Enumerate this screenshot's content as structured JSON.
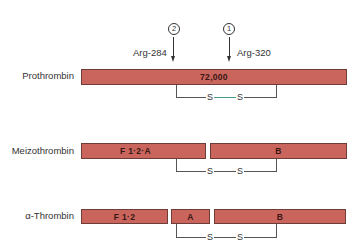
{
  "cleavage_sites": [
    {
      "number": "2",
      "label": "Arg-284"
    },
    {
      "number": "1",
      "label": "Arg-320"
    }
  ],
  "rows": [
    {
      "name": "Prothrombin",
      "segments": [
        {
          "label": "72,000"
        }
      ],
      "disulfide": {
        "left": "S",
        "right": "S"
      }
    },
    {
      "name": "Meizothrombin",
      "segments": [
        {
          "label": "F 1·2·A"
        },
        {
          "label": "B"
        }
      ],
      "disulfide": {
        "left": "S",
        "right": "S"
      }
    },
    {
      "name": "α-Thrombin",
      "segments": [
        {
          "label": "F 1·2"
        },
        {
          "label": "A"
        },
        {
          "label": "B"
        }
      ],
      "disulfide": {
        "left": "S",
        "right": "S"
      }
    }
  ],
  "colors": {
    "segment_fill": "#c9655d",
    "segment_border": "#6e3d38",
    "bond_line": "#555555",
    "bond_highlight": "#4a9a8a"
  }
}
